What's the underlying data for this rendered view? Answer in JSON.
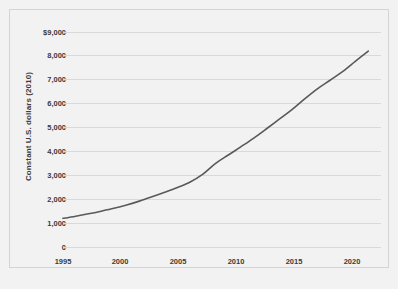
{
  "chart_data": {
    "type": "line",
    "title": "",
    "xlabel": "",
    "ylabel": "Constant U.S. dollars (2010)",
    "xlim": [
      1995,
      2020
    ],
    "ylim": [
      0,
      9000
    ],
    "grid": true,
    "legend": false,
    "legend_position": "none",
    "y_tick_labels": [
      "$9,000",
      "8,000",
      "7,000",
      "6,000",
      "5,000",
      "4,000",
      "3,000",
      "2,000",
      "1,000",
      "0"
    ],
    "y_ticks": [
      9000,
      8000,
      7000,
      6000,
      5000,
      4000,
      3000,
      2000,
      1000,
      0
    ],
    "x_tick_labels": [
      "1995",
      "2000",
      "2005",
      "2010",
      "2015",
      "2020"
    ],
    "x_ticks": [
      1995,
      2000,
      2005,
      2010,
      2015,
      2020
    ],
    "series": [
      {
        "name": "Constant U.S. dollars (2010)",
        "color": "#595959",
        "x": [
          1995,
          1996,
          1997,
          1998,
          1999,
          2000,
          2001,
          2002,
          2003,
          2004,
          2005,
          2006,
          2007,
          2008,
          2009,
          2010,
          2011,
          2012,
          2013,
          2014,
          2015,
          2016,
          2017,
          2018,
          2019
        ],
        "values": [
          1200,
          1290,
          1390,
          1500,
          1620,
          1760,
          1920,
          2100,
          2290,
          2490,
          2720,
          3050,
          3500,
          3850,
          4200,
          4560,
          4950,
          5350,
          5750,
          6200,
          6620,
          6980,
          7350,
          7780,
          8200
        ]
      }
    ]
  },
  "axis": {
    "y_title": "Constant U.S. dollars (2010)"
  },
  "ticks": {
    "y": [
      "$9,000",
      "8,000",
      "7,000",
      "6,000",
      "5,000",
      "4,000",
      "3,000",
      "2,000",
      "1,000",
      "0"
    ],
    "x": [
      "1995",
      "2000",
      "2005",
      "2010",
      "2015",
      "2020"
    ]
  },
  "colors": {
    "line": "#595959",
    "grid": "#d9d9d9",
    "text": "#3b3b3b",
    "plot_background": "#f2f2f2",
    "border": "#d4d4d4"
  }
}
